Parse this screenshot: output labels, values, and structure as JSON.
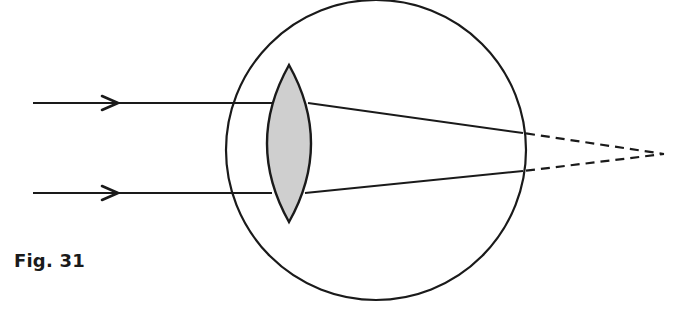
{
  "figure": {
    "caption": "Fig. 31"
  },
  "diagram": {
    "colors": {
      "stroke": "#1a1a1a",
      "lens_fill": "#cfcfcf",
      "background": "#ffffff"
    },
    "eyeball": {
      "cx": 376,
      "cy": 150,
      "r": 150
    },
    "lens": {
      "cx": 289,
      "top": 65,
      "bottom": 222,
      "half_width": 22
    },
    "rays": [
      {
        "name": "upper-ray",
        "start": [
          33,
          103
        ],
        "arrow_tip": [
          118,
          103
        ],
        "lens_entry": [
          272,
          103
        ],
        "lens_exit": [
          308,
          103
        ],
        "retina_point": [
          523,
          133
        ],
        "focus_point": [
          664,
          154
        ]
      },
      {
        "name": "lower-ray",
        "start": [
          33,
          193
        ],
        "arrow_tip": [
          118,
          193
        ],
        "lens_entry": [
          272,
          193
        ],
        "lens_exit": [
          305,
          193
        ],
        "retina_point": [
          523,
          171
        ],
        "focus_point": [
          664,
          154
        ]
      }
    ]
  }
}
